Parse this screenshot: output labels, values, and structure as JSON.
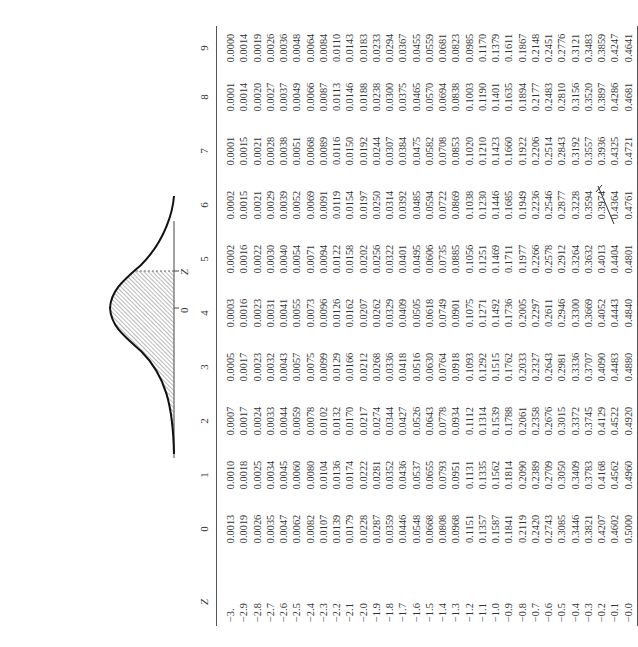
{
  "figure": {
    "curve_labels": {
      "zero": "0",
      "z": "Z"
    },
    "shaded_region": "left tail up to z"
  },
  "table": {
    "header": {
      "z_label": "Z",
      "columns": [
        "0",
        "1",
        "2",
        "3",
        "4",
        "5",
        "6",
        "7",
        "8",
        "9"
      ]
    },
    "rows": [
      {
        "z": "−3.",
        "v": [
          "0.0013",
          "0.0010",
          "0.0007",
          "0.0005",
          "0.0003",
          "0.0002",
          "0.0002",
          "0.0001",
          "0.0001",
          "0.0000"
        ]
      },
      {
        "z": "−2.9",
        "v": [
          "0.0019",
          "0.0018",
          "0.0017",
          "0.0017",
          "0.0016",
          "0.0016",
          "0.0015",
          "0.0015",
          "0.0014",
          "0.0014"
        ]
      },
      {
        "z": "−2.8",
        "v": [
          "0.0026",
          "0.0025",
          "0.0024",
          "0.0023",
          "0.0023",
          "0.0022",
          "0.0021",
          "0.0021",
          "0.0020",
          "0.0019"
        ]
      },
      {
        "z": "−2.7",
        "v": [
          "0.0035",
          "0.0034",
          "0.0033",
          "0.0032",
          "0.0031",
          "0.0030",
          "0.0029",
          "0.0028",
          "0.0027",
          "0.0026"
        ]
      },
      {
        "z": "−2.6",
        "v": [
          "0.0047",
          "0.0045",
          "0.0044",
          "0.0043",
          "0.0041",
          "0.0040",
          "0.0039",
          "0.0038",
          "0.0037",
          "0.0036"
        ]
      },
      {
        "z": "−2.5",
        "v": [
          "0.0062",
          "0.0060",
          "0.0059",
          "0.0057",
          "0.0055",
          "0.0054",
          "0.0052",
          "0.0051",
          "0.0049",
          "0.0048"
        ]
      },
      {
        "z": "−2.4",
        "v": [
          "0.0082",
          "0.0080",
          "0.0078",
          "0.0075",
          "0.0073",
          "0.0071",
          "0.0069",
          "0.0068",
          "0.0066",
          "0.0064"
        ]
      },
      {
        "z": "−2.3",
        "v": [
          "0.0107",
          "0.0104",
          "0.0102",
          "0.0099",
          "0.0096",
          "0.0094",
          "0.0091",
          "0.0089",
          "0.0087",
          "0.0084"
        ]
      },
      {
        "z": "−2.2",
        "v": [
          "0.0139",
          "0.0136",
          "0.0132",
          "0.0129",
          "0.0126",
          "0.0122",
          "0.0119",
          "0.0116",
          "0.0113",
          "0.0110"
        ]
      },
      {
        "z": "−2.1",
        "v": [
          "0.0179",
          "0.0174",
          "0.0170",
          "0.0166",
          "0.0162",
          "0.0158",
          "0.0154",
          "0.0150",
          "0.0146",
          "0.0143"
        ]
      },
      {
        "z": "−2.0",
        "v": [
          "0.0228",
          "0.0222",
          "0.0217",
          "0.0212",
          "0.0207",
          "0.0202",
          "0.0197",
          "0.0192",
          "0.0188",
          "0.0183"
        ]
      },
      {
        "z": "−1.9",
        "v": [
          "0.0287",
          "0.0281",
          "0.0274",
          "0.0268",
          "0.0262",
          "0.0256",
          "0.0250",
          "0.0244",
          "0.0238",
          "0.0233"
        ]
      },
      {
        "z": "−1.8",
        "v": [
          "0.0359",
          "0.0352",
          "0.0344",
          "0.0336",
          "0.0329",
          "0.0322",
          "0.0314",
          "0.0307",
          "0.0300",
          "0.0294"
        ]
      },
      {
        "z": "−1.7",
        "v": [
          "0.0446",
          "0.0436",
          "0.0427",
          "0.0418",
          "0.0409",
          "0.0401",
          "0.0392",
          "0.0384",
          "0.0375",
          "0.0367"
        ]
      },
      {
        "z": "−1.6",
        "v": [
          "0.0548",
          "0.0537",
          "0.0526",
          "0.0516",
          "0.0505",
          "0.0495",
          "0.0485",
          "0.0475",
          "0.0465",
          "0.0455"
        ]
      },
      {
        "z": "−1.5",
        "v": [
          "0.0668",
          "0.0655",
          "0.0643",
          "0.0630",
          "0.0618",
          "0.0606",
          "0.0594",
          "0.0582",
          "0.0570",
          "0.0559"
        ]
      },
      {
        "z": "−1.4",
        "v": [
          "0.0808",
          "0.0793",
          "0.0778",
          "0.0764",
          "0.0749",
          "0.0735",
          "0.0722",
          "0.0708",
          "0.0694",
          "0.0681"
        ]
      },
      {
        "z": "−1.3",
        "v": [
          "0.0968",
          "0.0951",
          "0.0934",
          "0.0918",
          "0.0901",
          "0.0885",
          "0.0869",
          "0.0853",
          "0.0838",
          "0.0823"
        ]
      },
      {
        "z": "−1.2",
        "v": [
          "0.1151",
          "0.1131",
          "0.1112",
          "0.1093",
          "0.1075",
          "0.1056",
          "0.1038",
          "0.1020",
          "0.1003",
          "0.0985"
        ]
      },
      {
        "z": "−1.1",
        "v": [
          "0.1357",
          "0.1335",
          "0.1314",
          "0.1292",
          "0.1271",
          "0.1251",
          "0.1230",
          "0.1210",
          "0.1190",
          "0.1170"
        ]
      },
      {
        "z": "−1.0",
        "v": [
          "0.1587",
          "0.1562",
          "0.1539",
          "0.1515",
          "0.1492",
          "0.1469",
          "0.1446",
          "0.1423",
          "0.1401",
          "0.1379"
        ]
      },
      {
        "z": "−0.9",
        "v": [
          "0.1841",
          "0.1814",
          "0.1788",
          "0.1762",
          "0.1736",
          "0.1711",
          "0.1685",
          "0.1660",
          "0.1635",
          "0.1611"
        ]
      },
      {
        "z": "−0.8",
        "v": [
          "0.2119",
          "0.2090",
          "0.2061",
          "0.2033",
          "0.2005",
          "0.1977",
          "0.1949",
          "0.1922",
          "0.1894",
          "0.1867"
        ]
      },
      {
        "z": "−0.7",
        "v": [
          "0.2420",
          "0.2389",
          "0.2358",
          "0.2327",
          "0.2297",
          "0.2266",
          "0.2236",
          "0.2206",
          "0.2177",
          "0.2148"
        ]
      },
      {
        "z": "−0.6",
        "v": [
          "0.2743",
          "0.2709",
          "0.2676",
          "0.2643",
          "0.2611",
          "0.2578",
          "0.2546",
          "0.2514",
          "0.2483",
          "0.2451"
        ]
      },
      {
        "z": "−0.5",
        "v": [
          "0.3085",
          "0.3050",
          "0.3015",
          "0.2981",
          "0.2946",
          "0.2912",
          "0.2877",
          "0.2843",
          "0.2810",
          "0.2776"
        ]
      },
      {
        "z": "−0.4",
        "v": [
          "0.3446",
          "0.3409",
          "0.3372",
          "0.3336",
          "0.3300",
          "0.3264",
          "0.3228",
          "0.3192",
          "0.3156",
          "0.3121"
        ]
      },
      {
        "z": "−0.3",
        "v": [
          "0.3821",
          "0.3783",
          "0.3745",
          "0.3707",
          "0.3669",
          "0.3632",
          "0.3594",
          "0.3557",
          "0.3520",
          "0.3483"
        ]
      },
      {
        "z": "−0.2",
        "v": [
          "0.4207",
          "0.4168",
          "0.4129",
          "0.4090",
          "0.4052",
          "0.4013",
          "0.3974",
          "0.3936",
          "0.3897",
          "0.3859"
        ]
      },
      {
        "z": "−0.1",
        "v": [
          "0.4602",
          "0.4562",
          "0.4522",
          "0.4483",
          "0.4443",
          "0.4404",
          "0.4364",
          "0.4325",
          "0.4286",
          "0.4247"
        ]
      },
      {
        "z": "−0.0",
        "v": [
          "0.5000",
          "0.4960",
          "0.4920",
          "0.4880",
          "0.4840",
          "0.4801",
          "0.4761",
          "0.4721",
          "0.4681",
          "0.4641"
        ]
      }
    ]
  },
  "annotation": {
    "handwritten_mark": "pen tick between 0.3974 and 0.4364 in column 6"
  }
}
